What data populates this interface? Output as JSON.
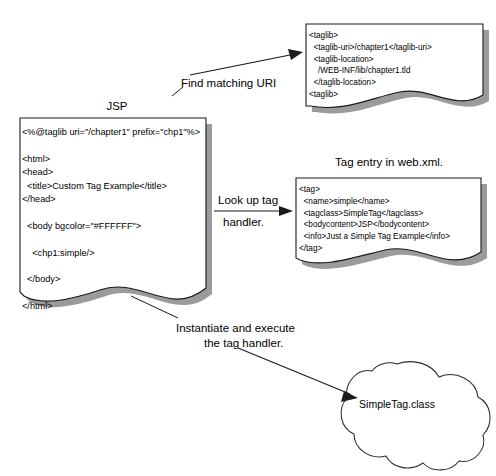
{
  "diagram": {
    "colors": {
      "stroke": "#1a1a1a",
      "shadow": "#7a7a7a",
      "shadow_light": "#9a9a9a",
      "paper": "#ffffff",
      "text": "#000000"
    }
  },
  "jsp_document": {
    "label": "JSP",
    "code": "<%@taglib uri=\"/chapter1\" prefix=\"chp1\"%>\n\n<html>\n<head>\n  <title>Custom Tag Example</title>\n</head>\n\n  <body bgcolor=\"#FFFFFF\">\n\n    <chp1:simple/>\n\n  </body>\n\n</html>"
  },
  "taglib_document": {
    "label": "",
    "code": "<taglib>\n  <taglib-uri>/chapter1</taglib-uri>\n  <taglib-location>\n    /WEB-INF/lib/chapter1.tld\n  </taglib-location>\n<taglib>"
  },
  "webxml_document": {
    "label": "Tag entry in web.xml.",
    "code": "<tag>\n  <name>simple</name>\n  <tagclass>SimpleTag</tagclass>\n  <bodycontent>JSP</bodycontent>\n  <info>Just a Simple Tag Example</info>\n</tag>"
  },
  "cloud": {
    "label": "SimpleTag.class"
  },
  "arrows": [
    {
      "id": "find-matching-uri",
      "label": "Find matching URI",
      "from": "jsp_document",
      "to": "taglib_document"
    },
    {
      "id": "look-up-tag-handler",
      "label_line1": "Look up tag",
      "label_line2": "handler.",
      "from": "jsp_document",
      "to": "webxml_document"
    },
    {
      "id": "instantiate-and-execute",
      "label_line1": "Instantiate and execute",
      "label_line2": "the tag handler.",
      "from": "jsp_document",
      "to": "cloud"
    }
  ]
}
